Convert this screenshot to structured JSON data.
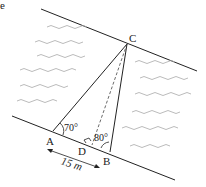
{
  "figure": {
    "corner_mark": "e",
    "points": {
      "A": {
        "label": "A"
      },
      "B": {
        "label": "B"
      },
      "C": {
        "label": "C"
      },
      "D": {
        "label": "D"
      }
    },
    "angles": {
      "at_A": "70°",
      "at_B": "80°"
    },
    "distance_AB": "15 m",
    "right_angle_at": "D"
  }
}
